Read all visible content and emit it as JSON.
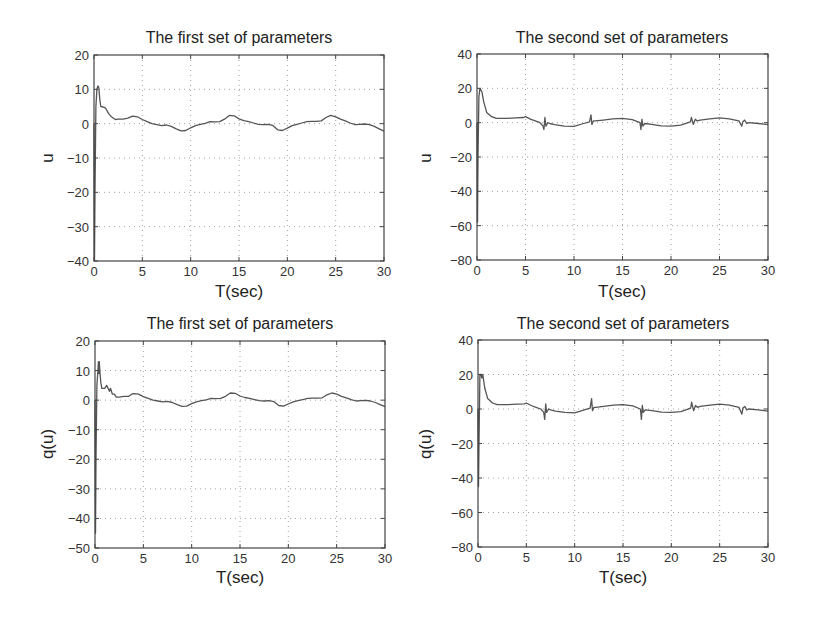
{
  "chart_data": [
    {
      "type": "line",
      "title": "The first set of parameters",
      "xlabel": "T(sec)",
      "ylabel": "u",
      "xlim": [
        0,
        30
      ],
      "ylim": [
        -40,
        20
      ],
      "xticks": [
        0,
        5,
        10,
        15,
        20,
        25,
        30
      ],
      "yticks": [
        -40,
        -30,
        -20,
        -10,
        0,
        10,
        20
      ],
      "grid": true,
      "series": [
        {
          "name": "u",
          "x": [
            0,
            0.05,
            0.1,
            0.2,
            0.3,
            0.4,
            0.5,
            0.6,
            0.7,
            1.0,
            1.2,
            1.5,
            1.8,
            2.2,
            2.5,
            3.0,
            3.5,
            4.0,
            4.5,
            5.0,
            5.5,
            6.0,
            6.5,
            7.0,
            7.5,
            8.0,
            8.5,
            9.0,
            9.5,
            10.0,
            10.5,
            11.0,
            11.5,
            12.0,
            12.5,
            13.0,
            13.5,
            14.0,
            14.5,
            15.0,
            15.5,
            16.0,
            16.5,
            17.0,
            17.5,
            18.0,
            18.5,
            19.0,
            19.5,
            20.0,
            20.5,
            21.0,
            21.5,
            22.0,
            22.5,
            23.0,
            23.5,
            24.0,
            24.5,
            25.0,
            25.5,
            26.0,
            26.5,
            27.0,
            27.5,
            28.0,
            28.5,
            29.0,
            29.5,
            30.0
          ],
          "y": [
            0,
            -40,
            -20,
            5,
            10,
            11,
            10.5,
            7,
            5,
            4.8,
            4.5,
            3,
            2,
            1.2,
            1.3,
            1.3,
            1.6,
            2.2,
            2.0,
            1.2,
            0.6,
            0.0,
            -0.3,
            -0.6,
            -0.4,
            -0.8,
            -1.5,
            -2.1,
            -2.0,
            -1.2,
            -0.6,
            -0.2,
            0.1,
            0.6,
            0.5,
            0.6,
            1.3,
            2.4,
            2.3,
            1.4,
            0.9,
            0.6,
            0.2,
            -0.2,
            -0.3,
            -0.2,
            -0.5,
            -1.8,
            -2.0,
            -1.3,
            -0.6,
            -0.2,
            0.2,
            0.6,
            0.7,
            0.7,
            0.8,
            1.8,
            2.4,
            2.0,
            1.3,
            0.8,
            0.2,
            -0.3,
            -0.2,
            -0.1,
            -0.3,
            -0.8,
            -1.5,
            -2.2
          ]
        }
      ]
    },
    {
      "type": "line",
      "title": "The second set of parameters",
      "xlabel": "T(sec)",
      "ylabel": "u",
      "xlim": [
        0,
        30
      ],
      "ylim": [
        -80,
        40
      ],
      "xticks": [
        0,
        5,
        10,
        15,
        20,
        25,
        30
      ],
      "yticks": [
        -80,
        -60,
        -40,
        -20,
        0,
        20,
        40
      ],
      "grid": true,
      "series": [
        {
          "name": "u",
          "x": [
            0,
            0.05,
            0.1,
            0.2,
            0.3,
            0.5,
            0.7,
            1.0,
            1.5,
            2.0,
            3.0,
            4.0,
            4.8,
            5.0,
            5.5,
            6.0,
            6.5,
            6.8,
            6.9,
            7.0,
            7.1,
            7.3,
            7.5,
            8.0,
            9.0,
            10.0,
            11.0,
            11.6,
            11.75,
            11.85,
            12.0,
            12.2,
            13.0,
            14.0,
            15.0,
            16.0,
            16.8,
            16.9,
            17.0,
            17.1,
            17.3,
            18.0,
            19.0,
            20.0,
            21.0,
            22.0,
            22.1,
            22.3,
            22.5,
            22.7,
            23.0,
            24.0,
            25.0,
            26.0,
            27.0,
            27.3,
            27.4,
            27.6,
            27.8,
            28.0,
            29.0,
            30.0
          ],
          "y": [
            0,
            -58,
            -20,
            15,
            20,
            18,
            12,
            6,
            3.5,
            2.5,
            2.5,
            2.8,
            3,
            3.5,
            2,
            1,
            0,
            -2,
            -4,
            3,
            -2,
            0,
            -0.5,
            -1.2,
            -2,
            -2.2,
            -0.5,
            0.5,
            4.5,
            -1,
            1,
            1,
            1.5,
            2.2,
            2.5,
            1.8,
            0,
            -4,
            2,
            -2,
            -0.5,
            -1,
            -1.8,
            -2,
            -1.5,
            0.5,
            3,
            -1,
            2,
            1,
            1.5,
            2.2,
            2.8,
            2.2,
            1,
            -2,
            0.5,
            1.5,
            -0.5,
            0,
            -0.5,
            -1.2
          ]
        }
      ]
    },
    {
      "type": "line",
      "title": "The first set of parameters",
      "xlabel": "T(sec)",
      "ylabel": "q(u)",
      "xlim": [
        0,
        30
      ],
      "ylim": [
        -50,
        20
      ],
      "xticks": [
        0,
        5,
        10,
        15,
        20,
        25,
        30
      ],
      "yticks": [
        -50,
        -40,
        -30,
        -20,
        -10,
        0,
        10,
        20
      ],
      "grid": true,
      "series": [
        {
          "name": "q(u)",
          "x": [
            0,
            0.05,
            0.1,
            0.2,
            0.3,
            0.35,
            0.4,
            0.45,
            0.5,
            0.55,
            0.6,
            0.7,
            0.9,
            1.0,
            1.2,
            1.5,
            1.6,
            1.8,
            2.0,
            2.2,
            2.5,
            3.0,
            3.5,
            3.8,
            4.0,
            4.5,
            5.0,
            5.5,
            6.0,
            6.5,
            7.0,
            7.5,
            8.0,
            8.5,
            9.0,
            9.5,
            10.0,
            10.5,
            11.0,
            11.5,
            12.0,
            12.5,
            13.0,
            13.5,
            14.0,
            14.5,
            15.0,
            15.5,
            16.0,
            16.5,
            17.0,
            17.5,
            18.0,
            18.5,
            19.0,
            19.5,
            20.0,
            20.5,
            21.0,
            21.5,
            22.0,
            22.5,
            23.0,
            23.5,
            24.0,
            24.5,
            25.0,
            25.5,
            26.0,
            26.5,
            27.0,
            27.5,
            28.0,
            28.5,
            29.0,
            29.5,
            30.0
          ],
          "y": [
            0,
            -45,
            -20,
            5,
            10,
            13,
            9,
            13,
            10,
            8,
            6,
            4,
            4,
            4,
            5,
            3,
            4,
            2,
            2,
            1,
            1,
            1.3,
            1.3,
            2,
            2.2,
            2.0,
            1.2,
            0.6,
            0.0,
            -0.3,
            -0.6,
            -0.4,
            -0.8,
            -1.5,
            -2.1,
            -2.0,
            -1.2,
            -0.6,
            -0.2,
            0.1,
            0.6,
            0.5,
            0.6,
            1.3,
            2.4,
            2.3,
            1.4,
            0.9,
            0.6,
            0.2,
            -0.2,
            -0.3,
            -0.2,
            -0.5,
            -1.8,
            -2.0,
            -1.3,
            -0.6,
            -0.2,
            0.2,
            0.6,
            0.7,
            0.7,
            0.8,
            1.8,
            2.4,
            2.0,
            1.3,
            0.8,
            0.2,
            -0.3,
            -0.2,
            -0.1,
            -0.3,
            -0.8,
            -1.5,
            -2.2
          ]
        }
      ]
    },
    {
      "type": "line",
      "title": "The second set of parameters",
      "xlabel": "T(sec)",
      "ylabel": "q(u)",
      "xlim": [
        0,
        30
      ],
      "ylim": [
        -80,
        40
      ],
      "xticks": [
        0,
        5,
        10,
        15,
        20,
        25,
        30
      ],
      "yticks": [
        -80,
        -60,
        -40,
        -20,
        0,
        20,
        40
      ],
      "grid": true,
      "series": [
        {
          "name": "q(u)",
          "x": [
            0,
            0.05,
            0.1,
            0.2,
            0.3,
            0.4,
            0.5,
            0.7,
            1.0,
            1.5,
            2.0,
            3.0,
            4.0,
            4.8,
            5.0,
            5.5,
            6.0,
            6.5,
            6.8,
            6.9,
            7.0,
            7.1,
            7.3,
            7.5,
            8.0,
            9.0,
            10.0,
            11.0,
            11.6,
            11.75,
            11.85,
            12.0,
            12.2,
            13.0,
            14.0,
            15.0,
            16.0,
            16.8,
            16.9,
            17.0,
            17.1,
            17.3,
            18.0,
            19.0,
            20.0,
            21.0,
            22.0,
            22.1,
            22.3,
            22.5,
            22.7,
            23.0,
            24.0,
            25.0,
            26.0,
            27.0,
            27.3,
            27.4,
            27.6,
            27.8,
            28.0,
            29.0,
            30.0
          ],
          "y": [
            0,
            -45,
            -20,
            20,
            20,
            18,
            20,
            12,
            6,
            3.5,
            2.5,
            2.5,
            2.8,
            3,
            3.5,
            2,
            1,
            0,
            -2,
            -6,
            3,
            -2,
            0,
            -0.5,
            -1.2,
            -2,
            -2.2,
            -0.5,
            0.5,
            6,
            -1,
            1,
            1,
            1.5,
            2.2,
            2.5,
            1.8,
            0,
            -6,
            2,
            -2,
            -0.5,
            -1,
            -1.8,
            -2,
            -1.5,
            0.5,
            4,
            -1,
            2,
            1,
            1.5,
            2.2,
            2.8,
            2.2,
            1,
            -3,
            0.5,
            1.5,
            -0.5,
            0,
            -0.5,
            -1.2
          ]
        }
      ]
    }
  ],
  "panels": [
    {
      "title": "The first set of parameters",
      "xlabel": "T(sec)",
      "ylabel": "u"
    },
    {
      "title": "The second set of parameters",
      "xlabel": "T(sec)",
      "ylabel": "u"
    },
    {
      "title": "The first set of parameters",
      "xlabel": "T(sec)",
      "ylabel": "q(u)"
    },
    {
      "title": "The second set of parameters",
      "xlabel": "T(sec)",
      "ylabel": "q(u)"
    }
  ],
  "colors": {
    "line": "#555555",
    "axes": "#444444",
    "grid": "#888888",
    "background": "#ffffff"
  }
}
